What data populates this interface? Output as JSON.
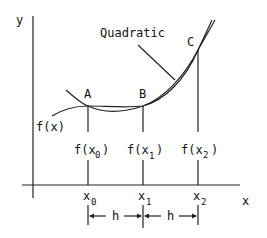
{
  "diagram": {
    "type": "quadratic-interpolation",
    "axes": {
      "x_label": "x",
      "y_label": "y"
    },
    "curve_labels": {
      "function": "f(x)",
      "interpolant": "Quadratic"
    },
    "points": [
      {
        "label": "A",
        "x": "x",
        "x_sub": "0",
        "f": "f(x",
        "f_sub": "0",
        "f_close": ")"
      },
      {
        "label": "B",
        "x": "x",
        "x_sub": "1",
        "f": "f(x",
        "f_sub": "1",
        "f_close": ")"
      },
      {
        "label": "C",
        "x": "x",
        "x_sub": "2",
        "f": "f(x",
        "f_sub": "2",
        "f_close": ")"
      }
    ],
    "spacing": [
      {
        "label": "h"
      },
      {
        "label": "h"
      }
    ],
    "colors": {
      "line": "#222222",
      "background": "#ffffff"
    }
  }
}
